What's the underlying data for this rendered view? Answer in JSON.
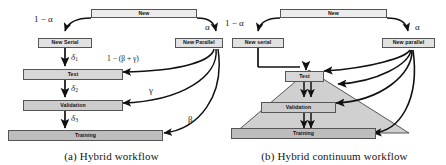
{
  "figure": {
    "panels": [
      {
        "id": "a",
        "caption": "(a) Hybrid workflow",
        "nodes": {
          "new": "New",
          "new_serial": "New Serial",
          "new_parallel": "New Parallel",
          "test": "Test",
          "validation": "Validation",
          "training": "Training"
        },
        "labels": {
          "split_serial": "1 − α",
          "split_parallel": "α",
          "delta1": "δ1",
          "delta2": "δ2",
          "delta3": "δ3",
          "to_test": "1 − (β + γ)",
          "to_validation": "γ",
          "to_training": "β"
        }
      },
      {
        "id": "b",
        "caption": "(b) Hybrid continuum workflow",
        "nodes": {
          "new": "New",
          "new_serial": "New serial",
          "new_parallel": "New parallel",
          "test": "Test",
          "validation": "Validation",
          "training": "Training"
        },
        "labels": {
          "split_serial": "1 − α",
          "split_parallel": "α"
        }
      }
    ],
    "colors": {
      "box_fill_light": "#ececec",
      "box_fill_dark": "#bdbdbd",
      "box_stroke": "#555555",
      "arrow": "#111111",
      "pyramid_fill": "#d0d0d0",
      "text": "#111111"
    }
  }
}
